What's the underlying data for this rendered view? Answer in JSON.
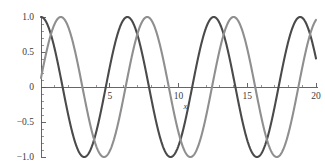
{
  "chart_data": {
    "type": "line",
    "title": "",
    "subtitle": "",
    "xlabel": "x",
    "ylabel": "",
    "xlim": [
      0,
      20
    ],
    "ylim": [
      -1.0,
      1.0
    ],
    "grid": false,
    "legend": "none",
    "x_ticks": [
      5,
      10,
      15,
      20
    ],
    "x_tick_labels": [
      "5",
      "10",
      "15",
      "20"
    ],
    "x_minor_tick_step": 1,
    "y_ticks": [
      -1.0,
      -0.5,
      0,
      0.5,
      1.0
    ],
    "y_tick_labels": [
      "-1.0",
      "-0.5",
      "0",
      "0.5",
      "1.0"
    ],
    "y_minor_tick_step": 0.1,
    "series": [
      {
        "name": "cos(x)",
        "color": "#4a4a4a",
        "linewidth": 2.1,
        "amplitude": 1.0,
        "frequency": 1.0,
        "phase": 0.0,
        "waveform": "cos",
        "peaks_x": [
          0,
          6.28,
          12.57,
          18.85
        ],
        "troughs_x": [
          3.14,
          9.42,
          15.71
        ],
        "values_at_ticks": {
          "0": 1.0,
          "5": 0.284,
          "10": -0.839,
          "15": -0.76,
          "20": 0.408
        }
      },
      {
        "name": "sin(x)",
        "color": "#8f8f8f",
        "linewidth": 2.1,
        "amplitude": 1.0,
        "frequency": 1.0,
        "phase": 0.13,
        "waveform": "sin",
        "peaks_x": [
          1.44,
          7.72,
          14.0
        ],
        "troughs_x": [
          4.58,
          10.87,
          17.15
        ],
        "values_at_ticks": {
          "0": 0.13,
          "5": -0.841,
          "10": -0.43,
          "15": 0.771,
          "20": 0.774
        }
      }
    ],
    "colors": {
      "series_1": "#4a4a4a",
      "series_2": "#8f8f8f",
      "axis": "#555555",
      "text": "#3c3c3c",
      "background": "#ffffff"
    },
    "axis_geometry": {
      "x_axis_y_value": 0,
      "y_axis_x_value": 0
    }
  }
}
